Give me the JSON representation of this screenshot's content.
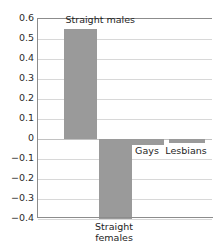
{
  "chart_data": {
    "type": "bar",
    "title": "",
    "subtitle": "",
    "xlabel": "",
    "ylabel": "",
    "categories": [
      "Straight males",
      "Straight females",
      "Gays",
      "Lesbians"
    ],
    "values": [
      0.55,
      -0.4,
      -0.03,
      -0.02
    ],
    "ylim": [
      -0.4,
      0.6
    ],
    "ytick_labels": [
      "0.6",
      "0.5",
      "0.4",
      "0.3",
      "0.2",
      "0.1",
      "0",
      "−0.1",
      "−0.2",
      "−0.3",
      "−0.4"
    ],
    "ytick_values": [
      0.6,
      0.5,
      0.4,
      0.3,
      0.2,
      0.1,
      0,
      -0.1,
      -0.2,
      -0.3,
      -0.4
    ],
    "grid": true,
    "legend": "none",
    "bar_color": "#9a9a9a",
    "grid_color": "#d8d8d8",
    "axis_color": "#8c8c8c",
    "annotations": [
      {
        "text": "Straight males",
        "for": "Straight males",
        "position": "above-bar"
      },
      {
        "text": "Straight",
        "for": "Straight females",
        "position": "below-axis-line1"
      },
      {
        "text": "females",
        "for": "Straight females",
        "position": "below-axis-line2"
      },
      {
        "text": "Gays",
        "for": "Gays",
        "position": "below-zero"
      },
      {
        "text": "Lesbians",
        "for": "Lesbians",
        "position": "below-zero"
      }
    ]
  }
}
